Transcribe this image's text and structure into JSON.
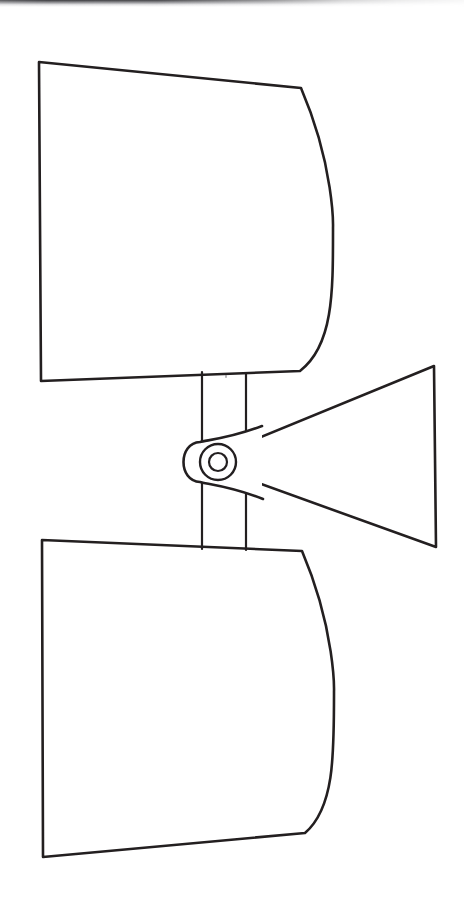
{
  "document": {
    "kind": "scanned-technical-line-drawing",
    "medium": "black ink on white paper",
    "title": "",
    "caption": "",
    "figure_label": "",
    "visible_text": "",
    "background_color": "#ffffff",
    "ink_color": "#231f20",
    "canvas": {
      "width": 464,
      "height": 904
    }
  },
  "scan_artifacts": {
    "top_edge_shadow": {
      "name": "scanner-edge-shadow",
      "color": "#282a2c",
      "x": 0,
      "y": 0,
      "width": 464,
      "height": 7,
      "fades_toward": "right"
    },
    "speck": {
      "name": "dust-speck",
      "x": 225,
      "y": 375,
      "color": "#787a7d"
    }
  },
  "drawing": {
    "subject": "hinged twin-panel pivoting assembly with wedge handle",
    "stroke_widths": {
      "outline": 2.6,
      "post": 2.2,
      "pivot_ring": 2.4,
      "pivot_core": 2.2
    },
    "parts": [
      {
        "name": "upper-panel",
        "description": "large quadrilateral blade with bowed right edge, upper half",
        "corners": [
          {
            "label": "top-left",
            "x": 39,
            "y": 62
          },
          {
            "label": "top-right",
            "x": 301,
            "y": 88
          },
          {
            "label": "bottom-right",
            "x": 300,
            "y": 371
          },
          {
            "label": "bottom-left",
            "x": 41,
            "y": 381
          }
        ],
        "right_edge": {
          "type": "bowed-arc",
          "bulge_x": 333,
          "bulge_y": 228
        }
      },
      {
        "name": "lower-panel",
        "description": "large quadrilateral blade with bowed right edge, lower half, mirrors upper",
        "corners": [
          {
            "label": "top-left",
            "x": 42,
            "y": 540
          },
          {
            "label": "top-right",
            "x": 302,
            "y": 551
          },
          {
            "label": "bottom-right",
            "x": 305,
            "y": 833
          },
          {
            "label": "bottom-left",
            "x": 43,
            "y": 857
          }
        ],
        "right_edge": {
          "type": "bowed-arc",
          "bulge_x": 334,
          "bulge_y": 692
        }
      },
      {
        "name": "center-post",
        "description": "vertical shaft of two parallel rails linking the panels, passes behind the pivot boss",
        "left_rail_x": 202,
        "right_rail_x": 246,
        "top_y": 372,
        "bottom_y": 549
      },
      {
        "name": "pivot-boss",
        "description": "rounded hinge knuckle capping the left end of the wedge",
        "center_x": 218,
        "center_y": 462,
        "cap_left_x": 186,
        "cap_height": 68
      },
      {
        "name": "pivot-ring-outer",
        "description": "outer concentric circle of the pivot",
        "center_x": 218,
        "center_y": 462,
        "radius": 18
      },
      {
        "name": "pivot-ring-inner",
        "description": "inner concentric circle of the pivot",
        "center_x": 218,
        "center_y": 462,
        "radius": 9
      },
      {
        "name": "wedge-handle",
        "description": "triangular tapering arm extending right from the pivot boss to a tall flat end",
        "apex_x": 200,
        "apex_y": 462,
        "top_edge_end": {
          "x": 434,
          "y": 366
        },
        "bottom_edge_end": {
          "x": 436,
          "y": 547
        },
        "end_face": {
          "top_y": 366,
          "bottom_y": 547,
          "x": 435
        }
      }
    ]
  }
}
